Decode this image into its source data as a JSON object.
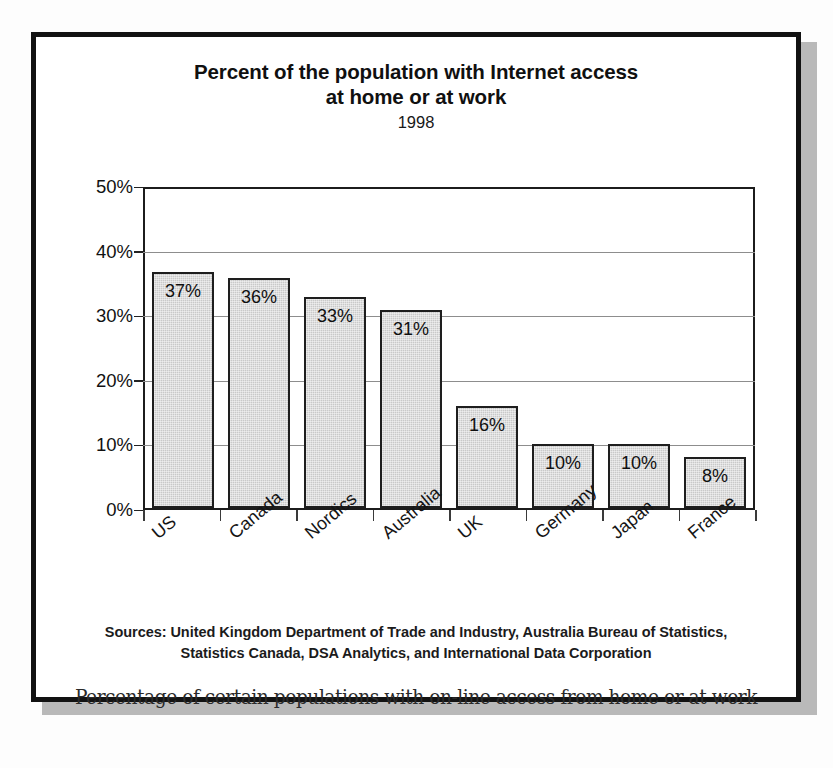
{
  "slide": {
    "title_lines": [
      "Percent of the population with Internet access",
      "at home or at work"
    ],
    "year": "1998",
    "caption": "Percentage of certain populations with on-line access from home or at work",
    "sources": [
      "Sources: United Kingdom Department of Trade and Industry, Australia Bureau of Statistics,",
      "Statistics Canada, DSA Analytics, and International Data Corporation"
    ]
  },
  "chart_data": {
    "type": "bar",
    "title": "Percent of the population with Internet access at home or at work",
    "subtitle": "1998",
    "xlabel": "",
    "ylabel": "",
    "ylim": [
      0,
      50
    ],
    "ytick_labels": [
      "0%",
      "10%",
      "20%",
      "30%",
      "40%",
      "50%"
    ],
    "ytick_values": [
      0,
      10,
      20,
      30,
      40,
      50
    ],
    "grid": true,
    "legend": "none",
    "categories": [
      "US",
      "Canada",
      "Nordics",
      "Australia",
      "UK",
      "Germany",
      "Japan",
      "France"
    ],
    "values": [
      37,
      36,
      33,
      31,
      16,
      10,
      10,
      8
    ],
    "data_labels": [
      "37%",
      "36%",
      "33%",
      "31%",
      "16%",
      "10%",
      "10%",
      "8%"
    ],
    "bar_fill": "#c9c9c9",
    "bar_edge": "#1e1e1e"
  },
  "style": {
    "frame_color": "#121212",
    "shadow_color": "#b9b9b9",
    "gridline_color": "#8d8d8d"
  }
}
